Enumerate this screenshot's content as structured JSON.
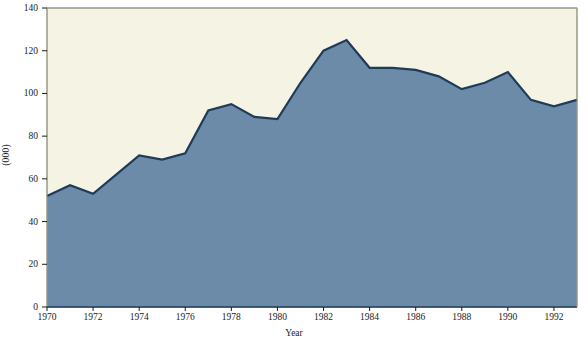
{
  "chart_data": {
    "type": "area",
    "title": "",
    "xlabel": "Year",
    "ylabel": "(000)",
    "xlim": [
      1970,
      1993
    ],
    "ylim": [
      0,
      140
    ],
    "ytick_labels": [
      "0",
      "20",
      "40",
      "60",
      "80",
      "100",
      "120",
      "140"
    ],
    "ytick_values": [
      0,
      20,
      40,
      60,
      80,
      100,
      120,
      140
    ],
    "xtick_labels": [
      "1970",
      "1972",
      "1974",
      "1976",
      "1978",
      "1980",
      "1982",
      "1984",
      "1986",
      "1988",
      "1990",
      "1992"
    ],
    "xtick_values": [
      1970,
      1972,
      1974,
      1976,
      1978,
      1980,
      1982,
      1984,
      1986,
      1988,
      1990,
      1992
    ],
    "grid": false,
    "legend": "none",
    "x": [
      1970,
      1971,
      1972,
      1973,
      1974,
      1975,
      1976,
      1977,
      1978,
      1979,
      1980,
      1981,
      1982,
      1983,
      1984,
      1985,
      1986,
      1987,
      1988,
      1989,
      1990,
      1991,
      1992,
      1993
    ],
    "series": [
      {
        "name": "(000)",
        "values": [
          52,
          57,
          53,
          62,
          71,
          69,
          72,
          92,
          95,
          89,
          88,
          105,
          120,
          125,
          112,
          112,
          111,
          108,
          102,
          105,
          110,
          97,
          94,
          97
        ],
        "fill_color": "#6b8ba8",
        "line_color": "#1f3b57"
      }
    ],
    "colors": {
      "plot_background": "#f5f3e4",
      "area_fill": "#6b8ba8",
      "area_line": "#1f3b57",
      "axis": "#9a9a82",
      "text": "#1a1a1a",
      "page_background": "#ffffff"
    }
  },
  "axes": {
    "ylabel": "(000)",
    "xlabel": "Year"
  }
}
